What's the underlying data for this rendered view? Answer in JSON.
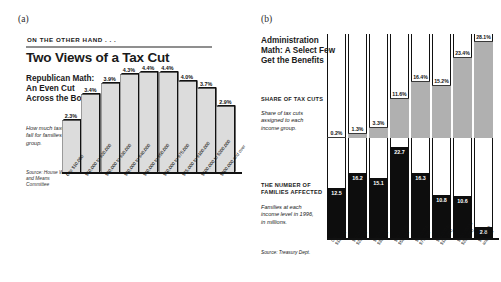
{
  "panels": {
    "a": {
      "tag": "(a)"
    },
    "b": {
      "tag": "(b)"
    }
  },
  "figure_a": {
    "kicker": "ON THE OTHER HAND . . .",
    "headline": "Two Views of a Tax Cut",
    "subhead": "Republican Math: An Even Cut Across the Board",
    "note": "How much taxes would fall for families in each group.",
    "source": "Source: House Ways and Means Committee"
  },
  "figure_b": {
    "subhead": "Administration Math: A Select Few Get the Benefits",
    "section1_title": "SHARE OF TAX CUTS",
    "section1_body": "Share of tax cuts assigned to each income group.",
    "section2_title": "THE NUMBER OF FAMILIES AFFECTED",
    "section2_body": "Families at each income level in 1996, in millions.",
    "source": "Source: Treasury Dept."
  },
  "colors": {
    "bar_gray_light": "#dcdcdc",
    "bar_gray_mid": "#b0b0b0",
    "bar_black": "#0d0d0d",
    "rule": "#8f8f8f",
    "axis": "#111111"
  },
  "chart_data": [
    {
      "type": "bar",
      "id": "republican-math",
      "title": "Republican Math: An Even Cut Across the Board",
      "subtitle": "How much taxes would fall for families in each group.",
      "xlabel": "",
      "ylabel": "Percent tax cut",
      "ylim": [
        0,
        5
      ],
      "grid": false,
      "legend": "none",
      "source": "Source: House Ways and Means Committee",
      "categories": [
        "0 to $10,000",
        "$10,000 to $20,000",
        "$20,000 to $30,000",
        "$30,000 to $40,000",
        "$40,000 to $50,000",
        "$50,000 to $75,000",
        "$75,000 to $100,000",
        "$100,000 to $200,000",
        "$200,000 and over"
      ],
      "values": [
        2.3,
        3.4,
        3.9,
        4.3,
        4.4,
        4.4,
        4.0,
        3.7,
        2.9
      ],
      "data_labels": [
        "2.3%",
        "3.4%",
        "3.9%",
        "4.3%",
        "4.4%",
        "4.4%",
        "4.0%",
        "3.7%",
        "2.9%"
      ]
    },
    {
      "type": "bar",
      "id": "administration-math",
      "title": "Administration Math: A Select Few Get the Benefits",
      "xlabel": "",
      "grid": false,
      "legend": "none",
      "source": "Source: Treasury Dept.",
      "categories": [
        "0 to $10,000",
        "$10,000 to $20,000",
        "$20,000 to $30,000",
        "$30,000 to $50,000",
        "$50,000 to $75,000",
        "$75,000 to $100,000",
        "$100,000 to $200,000",
        "$200,000 and over"
      ],
      "categories_line1": [
        "0 to",
        "$10,000 to",
        "$20,000 to",
        "$30,000 to",
        "$50,000 to",
        "$75,000 to",
        "$100,000 to",
        "$200,000"
      ],
      "categories_line2": [
        "$10,000",
        "$20,000",
        "$30,000",
        "$50,000",
        "$75,000",
        "$100,000",
        "$200,000",
        "and over"
      ],
      "series": [
        {
          "name": "Share of tax cuts",
          "unit": "percent",
          "ylim": [
            0,
            30
          ],
          "values": [
            0.2,
            1.3,
            3.3,
            11.6,
            16.4,
            15.2,
            23.4,
            28.1
          ],
          "data_labels": [
            "0.2%",
            "1.3%",
            "3.3%",
            "11.6%",
            "16.4%",
            "15.2%",
            "23.4%",
            "28.1%"
          ]
        },
        {
          "name": "Number of families affected",
          "unit": "millions",
          "ylim": [
            0,
            24
          ],
          "values": [
            12.5,
            16.2,
            15.1,
            22.7,
            16.3,
            10.8,
            10.6,
            2.8
          ],
          "data_labels": [
            "12.5",
            "16.2",
            "15.1",
            "22.7",
            "16.3",
            "10.8",
            "10.6",
            "2.8"
          ]
        }
      ]
    }
  ]
}
